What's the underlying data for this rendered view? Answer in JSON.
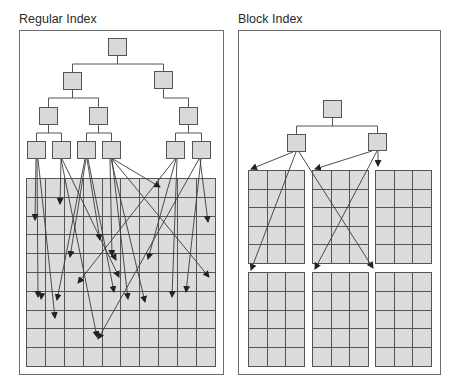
{
  "left": {
    "title": "Regular Index",
    "grid": {
      "columns": 10,
      "rows": 10
    },
    "tree_levels": 4,
    "leaf_nodes": 6
  },
  "right": {
    "title": "Block Index",
    "blocks": {
      "count": 6,
      "arrangement": "3x2",
      "columns_per_block": 3,
      "rows_per_block": 5
    },
    "tree_levels": 2
  },
  "colors": {
    "node_fill": "#d9d9d9",
    "cell_fill": "#dcdcdc",
    "line": "#555555",
    "arrow": "#333333",
    "title": "#2a2a2a"
  }
}
